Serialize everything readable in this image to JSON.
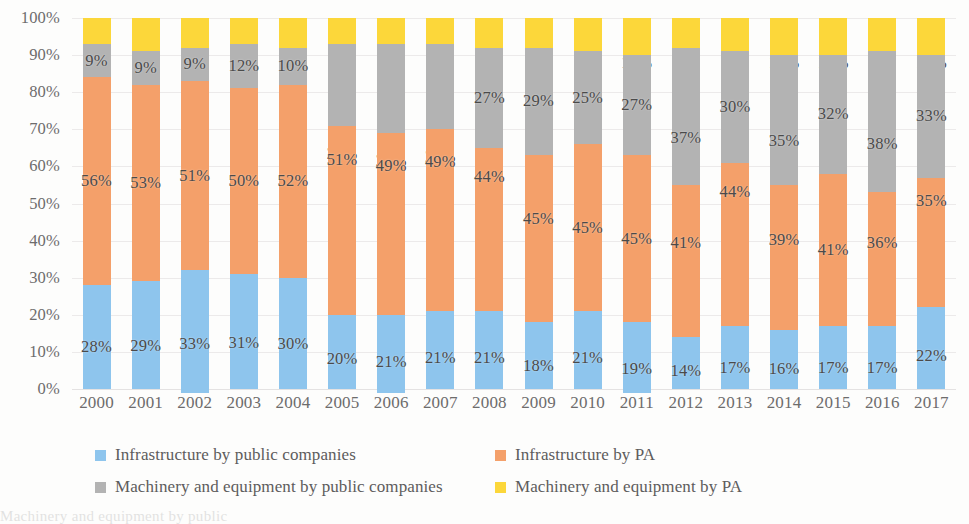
{
  "chart_data": {
    "type": "bar",
    "stacked": true,
    "stack_mode": "percent",
    "title": "",
    "subtitle": "",
    "xlabel": "",
    "ylabel": "",
    "ylim": [
      0,
      100
    ],
    "ytick_labels": [
      "100%",
      "90%",
      "80%",
      "70%",
      "60%",
      "50%",
      "40%",
      "30%",
      "20%",
      "10%",
      "0%"
    ],
    "ytick_values": [
      100,
      90,
      80,
      70,
      60,
      50,
      40,
      30,
      20,
      10,
      0
    ],
    "grid": true,
    "legend_position": "bottom",
    "categories": [
      "2000",
      "2001",
      "2002",
      "2003",
      "2004",
      "2005",
      "2006",
      "2007",
      "2008",
      "2009",
      "2010",
      "2011",
      "2012",
      "2013",
      "2014",
      "2015",
      "2016",
      "2017"
    ],
    "series": [
      {
        "name": "Infrastructure by public companies",
        "color": "#8ec5ed",
        "values": [
          28,
          29,
          33,
          31,
          30,
          20,
          21,
          21,
          21,
          18,
          21,
          19,
          14,
          17,
          16,
          17,
          17,
          22
        ],
        "labels": [
          "28%",
          "29%",
          "33%",
          "31%",
          "30%",
          "20%",
          "21%",
          "21%",
          "21%",
          "18%",
          "21%",
          "19%",
          "14%",
          "17%",
          "16%",
          "17%",
          "17%",
          "22%"
        ]
      },
      {
        "name": "Infrastructure by PA",
        "color": "#f4a06a",
        "values": [
          56,
          53,
          51,
          50,
          52,
          51,
          49,
          49,
          44,
          45,
          45,
          45,
          41,
          44,
          39,
          41,
          36,
          35
        ],
        "labels": [
          "56%",
          "53%",
          "51%",
          "50%",
          "52%",
          "51%",
          "49%",
          "49%",
          "44%",
          "45%",
          "45%",
          "45%",
          "41%",
          "44%",
          "39%",
          "41%",
          "36%",
          "35%"
        ]
      },
      {
        "name": "Machinery and equipment by public companies",
        "color": "#b3b3b3",
        "values": [
          9,
          9,
          9,
          12,
          10,
          22,
          24,
          23,
          27,
          29,
          25,
          27,
          37,
          30,
          35,
          32,
          38,
          33
        ],
        "labels": [
          "9%",
          "9%",
          "9%",
          "12%",
          "10%",
          "22%",
          "24%",
          "23%",
          "27%",
          "29%",
          "25%",
          "27%",
          "37%",
          "30%",
          "35%",
          "32%",
          "38%",
          "33%"
        ]
      },
      {
        "name": "Machinery and equipment by PA",
        "color": "#fcd73a",
        "values": [
          7,
          9,
          8,
          7,
          8,
          7,
          7,
          7,
          8,
          8,
          9,
          10,
          8,
          9,
          10,
          10,
          9,
          10
        ],
        "labels": [
          "7%",
          "9%",
          "8%",
          "7%",
          "8%",
          "7%",
          "7%",
          "7%",
          "8%",
          "8%",
          "9%",
          "10%",
          "8%",
          "9%",
          "10%",
          "10%",
          "9%",
          "10%"
        ]
      }
    ],
    "legend": [
      {
        "label": "Infrastructure by public companies",
        "color": "#8ec5ed"
      },
      {
        "label": "Infrastructure by PA",
        "color": "#f4a06a"
      },
      {
        "label": "Machinery and equipment by public companies",
        "color": "#b3b3b3"
      },
      {
        "label": "Machinery and equipment by PA",
        "color": "#fcd73a"
      }
    ]
  },
  "bottom_bleed": "Machinery and equipment by public"
}
